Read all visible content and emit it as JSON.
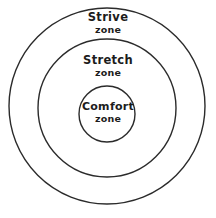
{
  "diagram": {
    "name": "comfort-stretch-strive-zones",
    "type": "concentric-circles",
    "background_color": "#ffffff",
    "stroke_color": "#2b2b2b",
    "text_color": "#1c1c1c",
    "canvas": {
      "width": 216,
      "height": 218
    },
    "zones": [
      {
        "id": "strive",
        "title": "Strive",
        "subtitle": "zone",
        "ring_index": 3,
        "circle": {
          "cx": 107,
          "cy": 106,
          "r": 98
        }
      },
      {
        "id": "stretch",
        "title": "Stretch",
        "subtitle": "zone",
        "ring_index": 2,
        "circle": {
          "cx": 107,
          "cy": 108,
          "r": 69
        }
      },
      {
        "id": "comfort",
        "title": "Comfort",
        "subtitle": "zone",
        "ring_index": 1,
        "circle": {
          "cx": 107,
          "cy": 114,
          "r": 28
        }
      }
    ]
  }
}
